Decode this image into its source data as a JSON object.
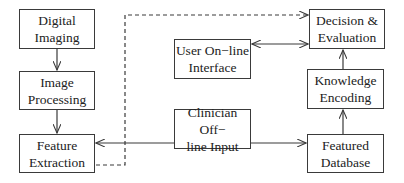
{
  "diagram": {
    "type": "flowchart",
    "nodes": [
      {
        "id": "digital_imaging",
        "label": "Digital\nImaging",
        "x": 19,
        "y": 9,
        "w": 76,
        "h": 40
      },
      {
        "id": "image_processing",
        "label": "Image\nProcessing",
        "x": 19,
        "y": 71,
        "w": 76,
        "h": 39
      },
      {
        "id": "feature_extraction",
        "label": "Feature\nExtraction",
        "x": 19,
        "y": 134,
        "w": 76,
        "h": 39
      },
      {
        "id": "user_online_interface",
        "label": "User On−line\nInterface",
        "x": 174,
        "y": 39,
        "w": 77,
        "h": 40
      },
      {
        "id": "clinician_offline_input",
        "label": "Clinician Off−\nline Input",
        "x": 174,
        "y": 109,
        "w": 77,
        "h": 40
      },
      {
        "id": "decision_evaluation",
        "label": "Decision &\nEvaluation",
        "x": 309,
        "y": 9,
        "w": 76,
        "h": 40
      },
      {
        "id": "knowledge_encoding",
        "label": "Knowledge\nEncoding",
        "x": 307,
        "y": 69,
        "w": 77,
        "h": 40
      },
      {
        "id": "featured_database",
        "label": "Featured\nDatabase",
        "x": 307,
        "y": 134,
        "w": 77,
        "h": 39
      }
    ],
    "edges": [
      {
        "from": "digital_imaging",
        "to": "image_processing",
        "style": "solid"
      },
      {
        "from": "image_processing",
        "to": "feature_extraction",
        "style": "solid"
      },
      {
        "from": "clinician_offline_input",
        "to": "feature_extraction",
        "style": "solid"
      },
      {
        "from": "clinician_offline_input",
        "to": "featured_database",
        "style": "solid"
      },
      {
        "from": "featured_database",
        "to": "knowledge_encoding",
        "style": "solid"
      },
      {
        "from": "knowledge_encoding",
        "to": "decision_evaluation",
        "style": "solid"
      },
      {
        "from": "user_online_interface",
        "to": "decision_evaluation",
        "style": "solid",
        "bidirectional": true
      },
      {
        "from": "feature_extraction",
        "to": "decision_evaluation",
        "style": "dashed"
      }
    ]
  }
}
